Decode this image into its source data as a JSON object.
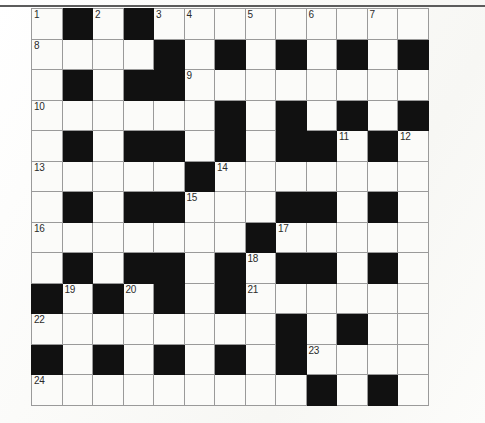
{
  "page": {
    "background_color": "#fdfdfc",
    "top_rule_color": "#5c5c5c"
  },
  "puzzle": {
    "type": "crossword-grid",
    "title": "",
    "columns": 13,
    "rows": 13,
    "cell_size_px": 30.5,
    "block_color": "#111111",
    "cell_color": "#fbfbf9",
    "grid_line_color": "#9a9a9a",
    "highest_clue_number": 24,
    "clue_numbers_visible": [
      1,
      2,
      3,
      4,
      5,
      6,
      7,
      8,
      9,
      10,
      11,
      12,
      13,
      14,
      15,
      16,
      17,
      18,
      19,
      20,
      21,
      22,
      23,
      24
    ],
    "legend": {
      "block": "#",
      "open": "."
    },
    "grid": [
      ".#.#.........",
      "....#.#.#.#.#",
      ".#.##........",
      "......#.#.#.#",
      ".#.##.#.##.#.",
      ".....#.......",
      ".#.##...##.#.",
      ".......#.....",
      ".#.##.#.##.#.",
      "#.#.#.#......",
      "........#.#..",
      "#.#.#.#.#....",
      ".........#.#."
    ],
    "numbers": [
      {
        "n": 1,
        "row": 1,
        "col": 1
      },
      {
        "n": 2,
        "row": 1,
        "col": 3
      },
      {
        "n": 3,
        "row": 1,
        "col": 5
      },
      {
        "n": 4,
        "row": 1,
        "col": 6
      },
      {
        "n": 5,
        "row": 1,
        "col": 8
      },
      {
        "n": 6,
        "row": 1,
        "col": 10
      },
      {
        "n": 7,
        "row": 1,
        "col": 12
      },
      {
        "n": 8,
        "row": 2,
        "col": 1
      },
      {
        "n": 9,
        "row": 3,
        "col": 6
      },
      {
        "n": 10,
        "row": 4,
        "col": 1
      },
      {
        "n": 11,
        "row": 5,
        "col": 11
      },
      {
        "n": 12,
        "row": 5,
        "col": 13
      },
      {
        "n": 13,
        "row": 6,
        "col": 1
      },
      {
        "n": 14,
        "row": 6,
        "col": 7
      },
      {
        "n": 15,
        "row": 7,
        "col": 6
      },
      {
        "n": 16,
        "row": 8,
        "col": 1
      },
      {
        "n": 17,
        "row": 8,
        "col": 9
      },
      {
        "n": 18,
        "row": 9,
        "col": 8
      },
      {
        "n": 19,
        "row": 10,
        "col": 2
      },
      {
        "n": 20,
        "row": 10,
        "col": 4
      },
      {
        "n": 21,
        "row": 10,
        "col": 8
      },
      {
        "n": 22,
        "row": 11,
        "col": 1
      },
      {
        "n": 23,
        "row": 12,
        "col": 10
      },
      {
        "n": 24,
        "row": 13,
        "col": 1
      }
    ],
    "entries": []
  }
}
